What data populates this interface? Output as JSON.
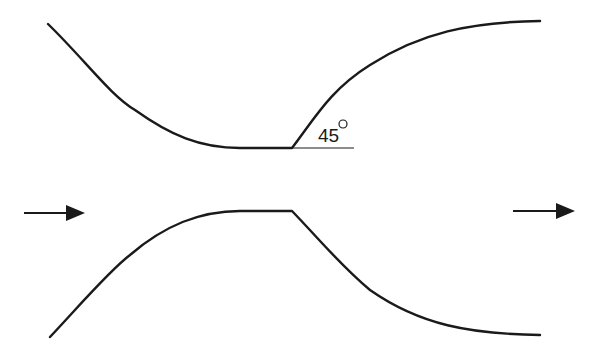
{
  "diagram": {
    "title": "",
    "angle_label": "45",
    "angle_unit_symbol": "degree",
    "flow_direction": "left-to-right",
    "colors": {
      "stroke": "#1a1a1a",
      "background": "#ffffff"
    }
  }
}
